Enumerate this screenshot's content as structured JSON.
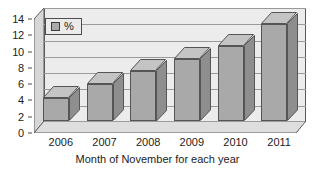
{
  "chart_data": {
    "type": "bar",
    "title": "",
    "subtitle": "",
    "xlabel": "Month of November for each year",
    "ylabel": "",
    "categories": [
      "2006",
      "2007",
      "2008",
      "2009",
      "2010",
      "2011"
    ],
    "values": [
      2.8,
      4.5,
      6.2,
      7.6,
      9.2,
      11.9
    ],
    "series": [
      {
        "name": "%",
        "values": [
          2.8,
          4.5,
          6.2,
          7.6,
          9.2,
          11.9
        ],
        "color": "#a9a9a9"
      }
    ],
    "ylim": [
      0,
      14
    ],
    "yticks": [
      0,
      2,
      4,
      6,
      8,
      10,
      12,
      14
    ],
    "ytick_labels": [
      "0",
      "2",
      "4",
      "6",
      "8",
      "10",
      "12",
      "14"
    ],
    "xtick_labels": [
      "2006",
      "2007",
      "2008",
      "2009",
      "2010",
      "2011"
    ],
    "grid": true,
    "grid_axis": "y",
    "legend": {
      "position": "top-left",
      "entries": [
        {
          "label": "%",
          "swatch_name": "legend-swatch-percent",
          "color": "#a9a9a9"
        }
      ]
    },
    "style": {
      "three_d": true,
      "bar_color": "#a9a9a9",
      "bar_top_color": "#c4c4c4",
      "bar_side_color": "#8e8e8e",
      "bar_border_color": "#555555",
      "plot_background": "#ececec",
      "floor_color": "#dedede",
      "wall_color": "#d6d6d6",
      "grid_color": "#9a9a9a",
      "axis_color": "#5a5a5a",
      "page_background": "#ffffff",
      "text_color": "#1c1c1c"
    }
  }
}
